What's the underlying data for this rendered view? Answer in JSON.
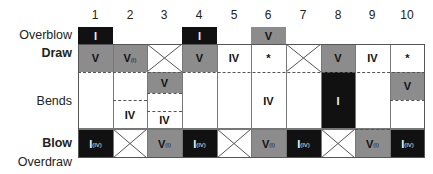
{
  "columns": [
    "1",
    "2",
    "3",
    "4",
    "5",
    "6",
    "7",
    "8",
    "9",
    "10"
  ],
  "row_labels": {
    "overblow": "Overblow",
    "draw": "Draw",
    "bends": "Bends",
    "blow": "Blow",
    "overdraw": "Overdraw"
  },
  "colors": {
    "gray": "#8c8c8c",
    "black": "#111111",
    "white": "#ffffff",
    "line": "#555555"
  },
  "overblow": [
    {
      "col": 1,
      "label": "I",
      "fill": "black"
    },
    {
      "col": 4,
      "label": "I",
      "fill": "black"
    },
    {
      "col": 6,
      "label": "V",
      "fill": "gray"
    }
  ],
  "draw": [
    {
      "col": 1,
      "label": "V",
      "sub": "",
      "fill": "gray"
    },
    {
      "col": 2,
      "label": "V",
      "sub": "(I)",
      "fill": "gray"
    },
    {
      "col": 3,
      "label": "",
      "sub": "",
      "fill": "x"
    },
    {
      "col": 4,
      "label": "V",
      "sub": "",
      "fill": "gray"
    },
    {
      "col": 5,
      "label": "IV",
      "sub": "",
      "fill": "white"
    },
    {
      "col": 6,
      "label": "*",
      "sub": "",
      "fill": "white"
    },
    {
      "col": 7,
      "label": "",
      "sub": "",
      "fill": "x"
    },
    {
      "col": 8,
      "label": "V",
      "sub": "",
      "fill": "gray"
    },
    {
      "col": 9,
      "label": "IV",
      "sub": "",
      "fill": "white"
    },
    {
      "col": 10,
      "label": "*",
      "sub": "",
      "fill": "white"
    }
  ],
  "bends": {
    "col2": {
      "label": "IV"
    },
    "col3": {
      "top": "V",
      "bottom": "IV"
    },
    "col6": {
      "label": "IV"
    },
    "col8": {
      "label": "I"
    },
    "col10": {
      "label": "V"
    }
  },
  "blow": [
    {
      "col": 1,
      "label": "I",
      "sub": "(IV)",
      "fill": "black"
    },
    {
      "col": 2,
      "label": "",
      "sub": "",
      "fill": "x"
    },
    {
      "col": 3,
      "label": "V",
      "sub": "(I)",
      "fill": "gray"
    },
    {
      "col": 4,
      "label": "I",
      "sub": "(IV)",
      "fill": "black"
    },
    {
      "col": 5,
      "label": "",
      "sub": "",
      "fill": "x"
    },
    {
      "col": 6,
      "label": "V",
      "sub": "(I)",
      "fill": "gray"
    },
    {
      "col": 7,
      "label": "I",
      "sub": "(IV)",
      "fill": "black"
    },
    {
      "col": 8,
      "label": "",
      "sub": "",
      "fill": "x"
    },
    {
      "col": 9,
      "label": "V",
      "sub": "(I)",
      "fill": "gray"
    },
    {
      "col": 10,
      "label": "I",
      "sub": "(IV)",
      "fill": "black"
    }
  ]
}
